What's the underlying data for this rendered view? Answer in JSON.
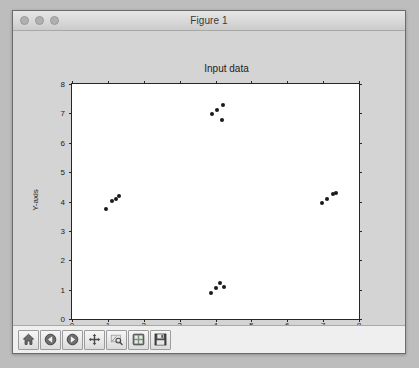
{
  "window": {
    "title": "Figure 1",
    "traffic_lights": [
      {
        "name": "close-button",
        "color": "#b0b0b0"
      },
      {
        "name": "minimize-button",
        "color": "#b0b0b0"
      },
      {
        "name": "zoom-button",
        "color": "#b0b0b0"
      }
    ]
  },
  "toolbar": {
    "buttons": [
      {
        "name": "home-button",
        "icon": "home-icon",
        "tooltip": "Reset original view"
      },
      {
        "name": "back-button",
        "icon": "back-arrow-icon",
        "tooltip": "Back to previous view"
      },
      {
        "name": "forward-button",
        "icon": "forward-arrow-icon",
        "tooltip": "Forward to next view"
      },
      {
        "name": "pan-button",
        "icon": "move-cross-icon",
        "tooltip": "Pan axes with left mouse, zoom with right"
      },
      {
        "name": "zoom-rect-button",
        "icon": "zoom-rect-icon",
        "tooltip": "Zoom to rectangle"
      },
      {
        "name": "configure-subplots-button",
        "icon": "sliders-icon",
        "tooltip": "Configure subplots"
      },
      {
        "name": "save-button",
        "icon": "floppy-disk-icon",
        "tooltip": "Save the figure"
      }
    ]
  },
  "chart_data": {
    "type": "scatter",
    "title": "Input data",
    "xlabel": "X-axis",
    "ylabel": "Y-axis",
    "xlim": [
      0,
      8
    ],
    "ylim": [
      0,
      8
    ],
    "xticks": [
      0,
      1,
      2,
      3,
      4,
      5,
      6,
      7,
      8
    ],
    "yticks": [
      0,
      1,
      2,
      3,
      4,
      5,
      6,
      7,
      8
    ],
    "grid": false,
    "legend": null,
    "marker_color": "#1a1a1a",
    "marker_size": 4,
    "series": [
      {
        "name": "cluster-left",
        "points": [
          {
            "x": 0.95,
            "y": 3.75
          },
          {
            "x": 1.12,
            "y": 4.02
          },
          {
            "x": 1.22,
            "y": 4.1
          },
          {
            "x": 1.3,
            "y": 4.18
          }
        ]
      },
      {
        "name": "cluster-top",
        "points": [
          {
            "x": 3.9,
            "y": 6.98
          },
          {
            "x": 4.05,
            "y": 7.12
          },
          {
            "x": 4.22,
            "y": 7.3
          },
          {
            "x": 4.18,
            "y": 6.78
          }
        ]
      },
      {
        "name": "cluster-bottom",
        "points": [
          {
            "x": 3.88,
            "y": 0.88
          },
          {
            "x": 4.0,
            "y": 1.06
          },
          {
            "x": 4.12,
            "y": 1.22
          },
          {
            "x": 4.25,
            "y": 1.1
          }
        ]
      },
      {
        "name": "cluster-right",
        "points": [
          {
            "x": 6.98,
            "y": 3.95
          },
          {
            "x": 7.12,
            "y": 4.08
          },
          {
            "x": 7.28,
            "y": 4.25
          },
          {
            "x": 7.35,
            "y": 4.3
          }
        ]
      }
    ]
  }
}
